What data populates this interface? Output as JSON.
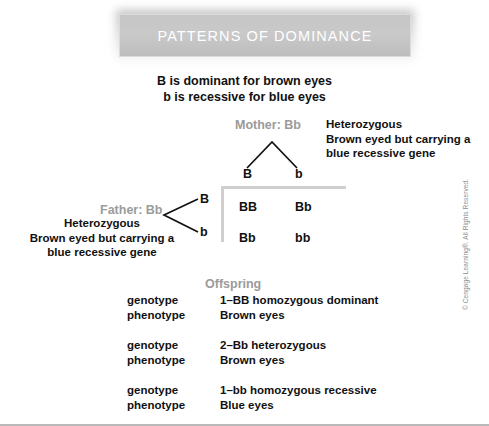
{
  "banner": {
    "title": "PATTERNS OF DOMINANCE"
  },
  "subtitle": {
    "line1": "B is dominant for brown eyes",
    "line2": "b is recessive for blue eyes"
  },
  "mother": {
    "label": "Mother: Bb",
    "allele_left": "B",
    "allele_right": "b",
    "note_line1": "Heterozygous",
    "note_line2": "Brown eyed but carrying a",
    "note_line3": "blue recessive gene"
  },
  "father": {
    "label": "Father: Bb",
    "allele_top": "B",
    "allele_bottom": "b",
    "note_line1": "Heterozygous",
    "note_line2": "Brown eyed but carrying a",
    "note_line3": "blue recessive gene"
  },
  "punnett": {
    "cells": [
      "BB",
      "Bb",
      "Bb",
      "bb"
    ]
  },
  "offspring": {
    "title": "Offspring",
    "key_genotype": "genotype",
    "key_phenotype": "phenotype",
    "groups": [
      {
        "genotype": "1–BB homozygous dominant",
        "phenotype": "Brown eyes"
      },
      {
        "genotype": "2–Bb heterozygous",
        "phenotype": "Brown eyes"
      },
      {
        "genotype": "1–bb homozygous recessive",
        "phenotype": "Blue eyes"
      }
    ]
  },
  "copyright": {
    "text": "© Cengage Learning®. All Rights Reserved."
  },
  "colors": {
    "banner_fill": "#c6c6c6",
    "gray_label": "#9b9b9b",
    "rule": "#cfcfcf",
    "text": "#111111"
  }
}
